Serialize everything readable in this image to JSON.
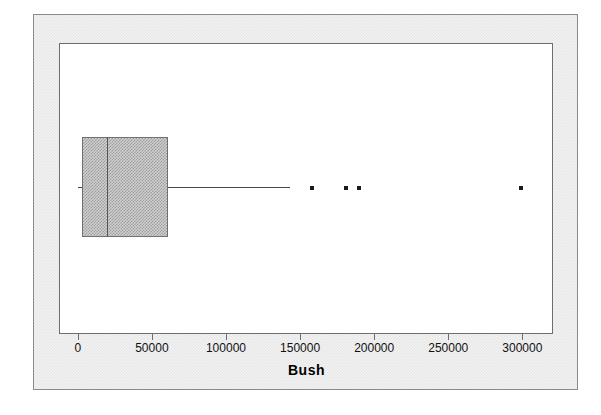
{
  "chart_data": {
    "type": "box",
    "title": "",
    "xlabel": "Bush",
    "ylabel": "",
    "xlim": [
      -12000,
      320000
    ],
    "xticks": [
      0,
      50000,
      100000,
      150000,
      200000,
      250000,
      300000
    ],
    "xtick_labels": [
      "0",
      "50000",
      "100000",
      "150000",
      "200000",
      "250000",
      "300000"
    ],
    "grid": false,
    "legend": null,
    "orientation": "horizontal",
    "boxes": [
      {
        "name": "Bush",
        "whisker_low": 0,
        "q1": 2700,
        "median": 20000,
        "q3": 61000,
        "whisker_high": 143000,
        "outliers": [
          158000,
          181000,
          190000,
          299000
        ]
      }
    ],
    "colors": {
      "box_fill": "#d0d0d0",
      "box_edge": "#707070",
      "median": "#555555",
      "whisker": "#4a4a4a",
      "outlier": "#1a1a1a",
      "plot_background": "#ffffff",
      "panel_background": "#f2f2f2",
      "frame": "#6e6e6e"
    }
  }
}
